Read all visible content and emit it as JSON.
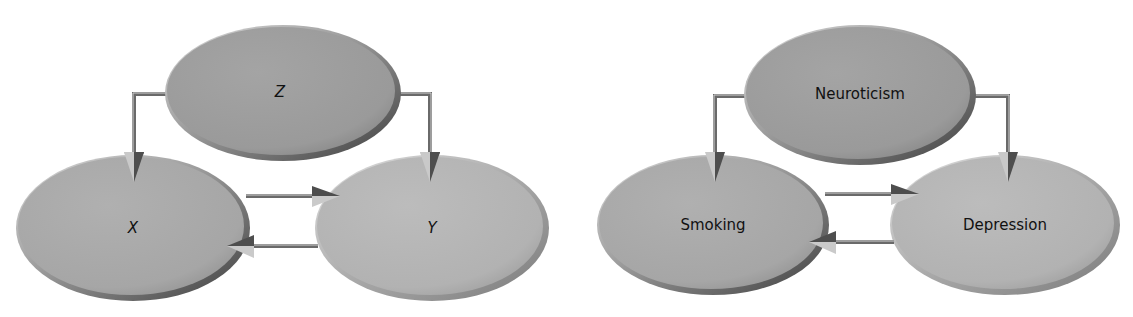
{
  "colors": {
    "background": "#ffffff",
    "node_top": "#9e9e9e",
    "node_left": "#a9a9a9",
    "node_right": "#b4b4b4",
    "edge_dark": "#555555",
    "edge_light": "#cfcfcf",
    "label": "#111111"
  },
  "diagrams": [
    {
      "name": "generic",
      "nodes": {
        "top": {
          "label": "Z"
        },
        "left": {
          "label": "X"
        },
        "right": {
          "label": "Y"
        }
      },
      "edges": [
        {
          "from": "Z",
          "to": "X"
        },
        {
          "from": "Z",
          "to": "Y"
        },
        {
          "from": "X",
          "to": "Y"
        },
        {
          "from": "Y",
          "to": "X"
        }
      ]
    },
    {
      "name": "example",
      "nodes": {
        "top": {
          "label": "Neuroticism"
        },
        "left": {
          "label": "Smoking"
        },
        "right": {
          "label": "Depression"
        }
      },
      "edges": [
        {
          "from": "Neuroticism",
          "to": "Smoking"
        },
        {
          "from": "Neuroticism",
          "to": "Depression"
        },
        {
          "from": "Smoking",
          "to": "Depression"
        },
        {
          "from": "Depression",
          "to": "Smoking"
        }
      ]
    }
  ]
}
